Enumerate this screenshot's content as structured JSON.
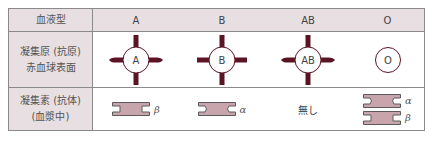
{
  "table": {
    "header": {
      "label": "血液型",
      "types": [
        "A",
        "B",
        "AB",
        "O"
      ]
    },
    "rows": [
      {
        "label_line1": "凝集原 (抗原)",
        "label_line2": "赤血球表面",
        "cells": [
          {
            "antigen_label": "A",
            "icon": "red-blood-cell-with-a-antigens-icon"
          },
          {
            "antigen_label": "B",
            "icon": "red-blood-cell-with-b-antigens-icon"
          },
          {
            "antigen_label": "AB",
            "icon": "red-blood-cell-with-ab-antigens-icon"
          },
          {
            "antigen_label": "O",
            "icon": "red-blood-cell-no-antigen-icon"
          }
        ]
      },
      {
        "label_line1": "凝集素 (抗体)",
        "label_line2": "(血漿中)",
        "cells": [
          {
            "antibodies": [
              "β"
            ],
            "icon": "antibody-beta-icon"
          },
          {
            "antibodies": [
              "α"
            ],
            "icon": "antibody-alpha-icon"
          },
          {
            "text": "無し"
          },
          {
            "antibodies": [
              "α",
              "β"
            ],
            "icon": "antibody-alpha-beta-icon"
          }
        ]
      }
    ]
  },
  "colors": {
    "header_bg": "#e7dfe2",
    "border": "#8a8a8a",
    "antigen": "#5c1424",
    "antibody_fill": "#c8a5ad",
    "antibody_stroke": "#5a5a5a"
  }
}
